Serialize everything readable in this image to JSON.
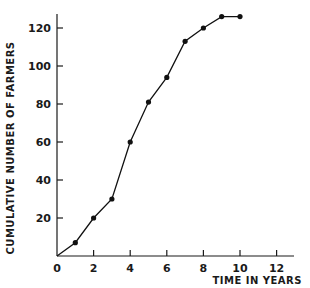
{
  "chart_data": {
    "type": "line",
    "title": "",
    "xlabel": "TIME IN YEARS",
    "ylabel": "CUMULATIVE NUMBER OF FARMERS",
    "xlim": [
      0,
      13
    ],
    "ylim": [
      0,
      128
    ],
    "xticks": [
      0,
      2,
      4,
      6,
      8,
      10,
      12
    ],
    "xtick_labels": [
      "0",
      "2",
      "4",
      "6",
      "8",
      "10",
      "12"
    ],
    "yticks": [
      20,
      40,
      60,
      80,
      100,
      120
    ],
    "ytick_labels": [
      "20",
      "40",
      "60",
      "80",
      "100",
      "120"
    ],
    "grid": false,
    "legend": null,
    "series": [
      {
        "name": "Cumulative farmers",
        "x": [
          0,
          1,
          2,
          3,
          4,
          5,
          6,
          7,
          8,
          9,
          10
        ],
        "y": [
          0,
          7,
          20,
          30,
          60,
          81,
          94,
          113,
          120,
          126,
          126
        ],
        "markers": [
          false,
          true,
          true,
          true,
          true,
          true,
          true,
          true,
          true,
          true,
          true
        ]
      }
    ]
  }
}
